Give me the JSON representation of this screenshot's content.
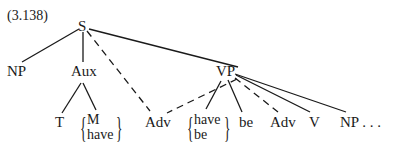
{
  "label": "(3.138)",
  "nodes": {
    "root": "S",
    "np": "NP",
    "aux": "Aux",
    "vp": "VP",
    "t": "T",
    "aux_choice": [
      "M",
      "have"
    ],
    "adv_mid": "Adv",
    "vp_choice": [
      "have",
      "be"
    ],
    "be": "be",
    "adv_vp": "Adv",
    "v": "V",
    "np_vp": "NP . . ."
  },
  "edges": [
    {
      "from": "S",
      "to": "NP",
      "style": "solid"
    },
    {
      "from": "S",
      "to": "Aux",
      "style": "solid"
    },
    {
      "from": "S",
      "to": "Adv",
      "style": "dashed"
    },
    {
      "from": "S",
      "to": "VP",
      "style": "solid"
    },
    {
      "from": "Aux",
      "to": "T",
      "style": "solid"
    },
    {
      "from": "Aux",
      "to": "{M, have}",
      "style": "solid"
    },
    {
      "from": "VP",
      "to": "Adv",
      "style": "dashed"
    },
    {
      "from": "VP",
      "to": "{have, be}",
      "style": "solid"
    },
    {
      "from": "VP",
      "to": "be",
      "style": "solid"
    },
    {
      "from": "VP",
      "to": "Adv",
      "style": "dashed"
    },
    {
      "from": "VP",
      "to": "V",
      "style": "solid"
    },
    {
      "from": "VP",
      "to": "NP",
      "style": "solid"
    }
  ]
}
